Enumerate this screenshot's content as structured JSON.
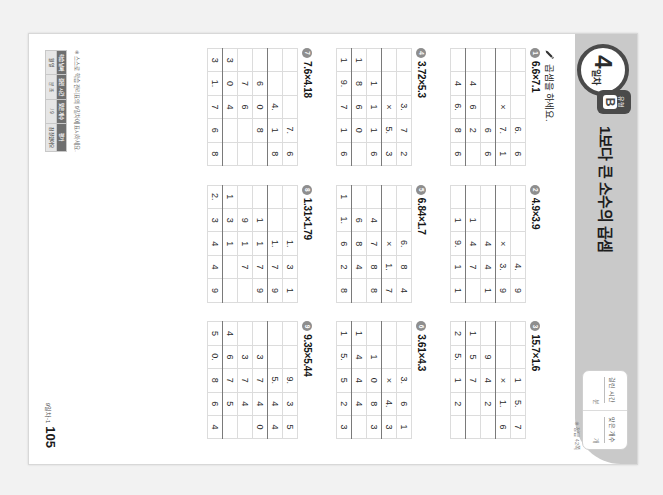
{
  "page": {
    "background_color": "#f2f2f2",
    "paper_color": "#ffffff",
    "band_color": "#c9c9c9",
    "accent_dark": "#4a4a4a"
  },
  "header": {
    "day_number": "4",
    "day_suffix": "일차",
    "type_small_label": "유형",
    "type_letter": "B",
    "unit_title": "1보다 큰 소수의 곱셈",
    "score_box": {
      "time_label": "걸린 시간",
      "time_unit": "분",
      "count_label": "맞은 개수",
      "count_unit": "개"
    },
    "top_note": "※ 정답 42쪽"
  },
  "instruction": {
    "icon": "pencil-icon",
    "text": "곱셈을 하세요."
  },
  "problems": [
    {
      "number": "1",
      "expression": "6.6×7.1",
      "rows": [
        [
          "",
          "",
          "",
          "6.",
          "6"
        ],
        [
          "",
          "",
          "×",
          "7.",
          "1"
        ],
        [
          "",
          "",
          "",
          "6",
          "6"
        ],
        [
          "",
          "4",
          "6",
          "2",
          ""
        ],
        [
          "",
          "4",
          "6.",
          "8",
          "6"
        ]
      ],
      "underline_after": [
        1,
        3
      ]
    },
    {
      "number": "2",
      "expression": "4.9×3.9",
      "rows": [
        [
          "",
          "",
          "",
          "4.",
          "9"
        ],
        [
          "",
          "",
          "×",
          "3.",
          "9"
        ],
        [
          "",
          "",
          "4",
          "4",
          "1"
        ],
        [
          "",
          "1",
          "4",
          "7",
          ""
        ],
        [
          "",
          "1",
          "9.",
          "1",
          "1"
        ]
      ],
      "underline_after": [
        1,
        3
      ]
    },
    {
      "number": "3",
      "expression": "15.7×1.6",
      "rows": [
        [
          "",
          "",
          "1",
          "5.",
          "7"
        ],
        [
          "",
          "",
          "×",
          "1.",
          "6"
        ],
        [
          "",
          "9",
          "4",
          "2",
          ""
        ],
        [
          "1",
          "5",
          "7",
          "",
          ""
        ],
        [
          "2",
          "5.",
          "1",
          "2",
          ""
        ]
      ],
      "underline_after": [
        1,
        3
      ]
    },
    {
      "number": "4",
      "expression": "3.72×5.3",
      "rows": [
        [
          "",
          "",
          "3.",
          "7",
          "2"
        ],
        [
          "",
          "",
          "×",
          "5.",
          "3"
        ],
        [
          "",
          "1",
          "1",
          "1",
          "6"
        ],
        [
          "1",
          "8",
          "6",
          "0",
          ""
        ],
        [
          "1",
          "9.",
          "7",
          "1",
          "6"
        ]
      ],
      "underline_after": [
        1,
        3
      ]
    },
    {
      "number": "5",
      "expression": "6.84×1.7",
      "rows": [
        [
          "",
          "",
          "6.",
          "8",
          "4"
        ],
        [
          "",
          "",
          "×",
          "1.",
          "7"
        ],
        [
          "",
          "4",
          "7",
          "8",
          "8"
        ],
        [
          "",
          "6",
          "8",
          "4",
          ""
        ],
        [
          "1",
          "1.",
          "6",
          "2",
          "8"
        ]
      ],
      "underline_after": [
        1,
        3
      ]
    },
    {
      "number": "6",
      "expression": "3.61×4.3",
      "rows": [
        [
          "",
          "",
          "3.",
          "6",
          "1"
        ],
        [
          "",
          "",
          "×",
          "4.",
          "3"
        ],
        [
          "",
          "1",
          "0",
          "8",
          "3"
        ],
        [
          "1",
          "4",
          "4",
          "4",
          ""
        ],
        [
          "1",
          "5.",
          "5",
          "2",
          "3"
        ]
      ],
      "underline_after": [
        1,
        3
      ]
    },
    {
      "number": "7",
      "expression": "7.6×4.18",
      "rows": [
        [
          "",
          "",
          "",
          "7.",
          "6"
        ],
        [
          "",
          "",
          "4.",
          "1",
          "8"
        ],
        [
          "",
          "6",
          "0",
          "8",
          ""
        ],
        [
          "",
          "7",
          "6",
          "",
          ""
        ],
        [
          "3",
          "0",
          "4",
          "",
          ""
        ],
        [
          "3",
          "1.",
          "7",
          "6",
          "8"
        ]
      ],
      "underline_after": [
        1,
        4
      ]
    },
    {
      "number": "8",
      "expression": "1.31×1.79",
      "rows": [
        [
          "",
          "",
          "1.",
          "3",
          "1"
        ],
        [
          "",
          "",
          "1.",
          "7",
          "9"
        ],
        [
          "",
          "1",
          "1",
          "7",
          "9"
        ],
        [
          "",
          "9",
          "1",
          "7",
          ""
        ],
        [
          "1",
          "3",
          "1",
          "",
          ""
        ],
        [
          "2.",
          "3",
          "4",
          "4",
          "9"
        ]
      ],
      "underline_after": [
        1,
        4
      ]
    },
    {
      "number": "9",
      "expression": "9.35×5.44",
      "rows": [
        [
          "",
          "",
          "9.",
          "3",
          "5"
        ],
        [
          "",
          "",
          "5.",
          "4",
          "4"
        ],
        [
          "",
          "3",
          "7",
          "4",
          "0"
        ],
        [
          "",
          "3",
          "7",
          "4",
          ""
        ],
        [
          "4",
          "6",
          "7",
          "5",
          ""
        ],
        [
          "5",
          "0.",
          "8",
          "6",
          "4"
        ]
      ],
      "underline_after": [
        1,
        4
      ]
    }
  ],
  "footer": {
    "note": "※ 스스로 학습 관리표의 9일차에 표시하세요.",
    "eval_table": {
      "header": [
        "학습 날짜",
        "걸린 시간",
        "맞은 개수",
        "평가"
      ],
      "row": [
        "월    일",
        "분    초",
        "/    9",
        "참  잘했어요"
      ]
    },
    "page_tag": "9일차-1",
    "page_number": "105"
  }
}
